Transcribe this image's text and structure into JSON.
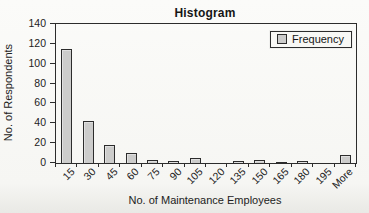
{
  "window": {
    "background": "#f8f8f5"
  },
  "chart_data": {
    "type": "bar",
    "title": "Histogram",
    "xlabel": "No. of Maintenance Employees",
    "ylabel": "No. of Respondents",
    "categories": [
      "15",
      "30",
      "45",
      "60",
      "75",
      "90",
      "105",
      "120",
      "135",
      "150",
      "165",
      "180",
      "195",
      "More"
    ],
    "values": [
      115,
      42,
      18,
      10,
      3,
      2,
      5,
      0,
      2,
      3,
      1,
      2,
      0,
      8
    ],
    "ylim": [
      0,
      140
    ],
    "y_ticks": [
      0,
      20,
      40,
      60,
      80,
      100,
      120,
      140
    ],
    "grid": false,
    "legend": {
      "position": "top-right-inside",
      "entries": [
        {
          "label": "Frequency",
          "swatch_color": "#cccccb"
        }
      ]
    },
    "bar_fill": "#cccccb",
    "bar_border": "#2c2c2c"
  }
}
